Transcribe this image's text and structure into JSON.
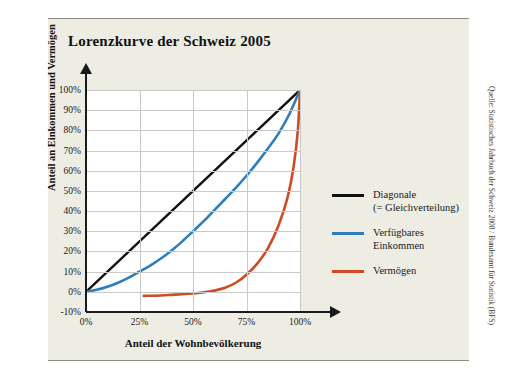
{
  "figure": {
    "title": "Lorenzkurve der Schweiz 2005",
    "source": "Quelle: Statistisches Jahrbuch der Schweiz 2008 / Bundesamt für Statistik (BFS)"
  },
  "colors": {
    "panel_background": "#edede4",
    "plot_background": "#ffffff",
    "gridline": "#c9c9c9",
    "axis": "#1a1a1a",
    "diagonal": "#111111",
    "income": "#2e7ebb",
    "wealth": "#cf4a25",
    "rule": "#8d8d85"
  },
  "chart_data": {
    "type": "line",
    "title": "Lorenzkurve der Schweiz 2005",
    "xlabel": "Anteil der Wohnbevölkerung",
    "ylabel": "Anteil an Einkommen und Vermögen",
    "xlim": [
      0,
      100
    ],
    "ylim": [
      -10,
      100
    ],
    "xticks": [
      0,
      25,
      50,
      75,
      100
    ],
    "xticklabels": [
      "0%",
      "25%",
      "50%",
      "75%",
      "100%"
    ],
    "yticks": [
      -10,
      0,
      10,
      20,
      30,
      40,
      50,
      60,
      70,
      80,
      90,
      100
    ],
    "yticklabels": [
      "-10%",
      "0%",
      "10%",
      "20%",
      "30%",
      "40%",
      "50%",
      "60%",
      "70%",
      "80%",
      "90%",
      "100%"
    ],
    "grid": true,
    "legend_position": "right",
    "series": [
      {
        "name": "Diagonale (= Gleichverteilung)",
        "legend_label_lines": [
          "Diagonale",
          "(= Gleichverteilung)"
        ],
        "color": "#111111",
        "x": [
          0,
          100
        ],
        "y": [
          0,
          100
        ]
      },
      {
        "name": "Verfügbares Einkommen",
        "legend_label_lines": [
          "Verfügbares",
          "Einkommen"
        ],
        "color": "#2e7ebb",
        "x": [
          0,
          5,
          10,
          15,
          20,
          25,
          30,
          35,
          40,
          45,
          50,
          55,
          60,
          65,
          70,
          75,
          80,
          85,
          90,
          95,
          100
        ],
        "y": [
          0,
          1,
          2.5,
          4.5,
          7,
          10,
          13,
          16.5,
          20.5,
          25,
          30,
          35,
          40.5,
          46,
          51.5,
          57.5,
          64,
          71,
          78.5,
          88,
          100
        ]
      },
      {
        "name": "Vermögen",
        "legend_label_lines": [
          "Vermögen"
        ],
        "color": "#cf4a25",
        "x": [
          27,
          35,
          40,
          45,
          50,
          55,
          60,
          65,
          70,
          75,
          80,
          85,
          90,
          94,
          97,
          99,
          100
        ],
        "y": [
          -2,
          -1.8,
          -1.5,
          -1.2,
          -0.8,
          -0.2,
          0.6,
          2,
          4.5,
          8.5,
          14,
          21.5,
          33,
          46,
          62,
          80,
          100
        ]
      }
    ]
  },
  "axes": {
    "x_title": "Anteil der Wohnbevölkerung",
    "y_title": "Anteil an Einkommen und Vermögen"
  }
}
